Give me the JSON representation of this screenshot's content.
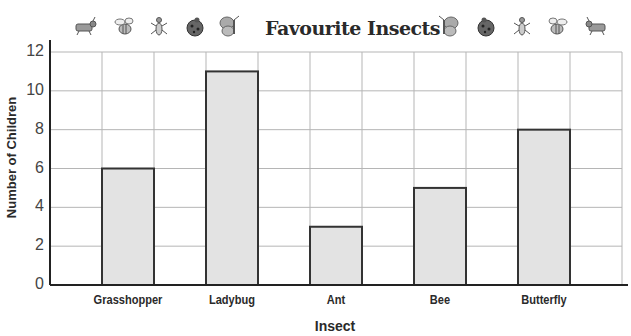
{
  "chart_data": {
    "type": "bar",
    "title": "Favourite Insects",
    "xlabel": "Insect",
    "ylabel": "Number of Children",
    "categories": [
      "Grasshopper",
      "Ladybug",
      "Ant",
      "Bee",
      "Butterfly"
    ],
    "values": [
      6,
      11,
      3,
      5,
      8
    ],
    "ylim": [
      0,
      12
    ],
    "yticks": [
      "0",
      "2",
      "4",
      "6",
      "8",
      "10",
      "12"
    ],
    "grid": true,
    "legend": null,
    "bar_color": "#e3e3e3",
    "bar_edge_color": "#333333",
    "grid_color": "#b5b5b5"
  },
  "decorations": {
    "left_icons": [
      "grasshopper-icon",
      "bee-icon",
      "ant-icon",
      "ladybug-icon",
      "butterfly-icon"
    ],
    "right_icons": [
      "butterfly-icon",
      "ladybug-icon",
      "ant-icon",
      "bee-icon",
      "grasshopper-icon"
    ]
  }
}
